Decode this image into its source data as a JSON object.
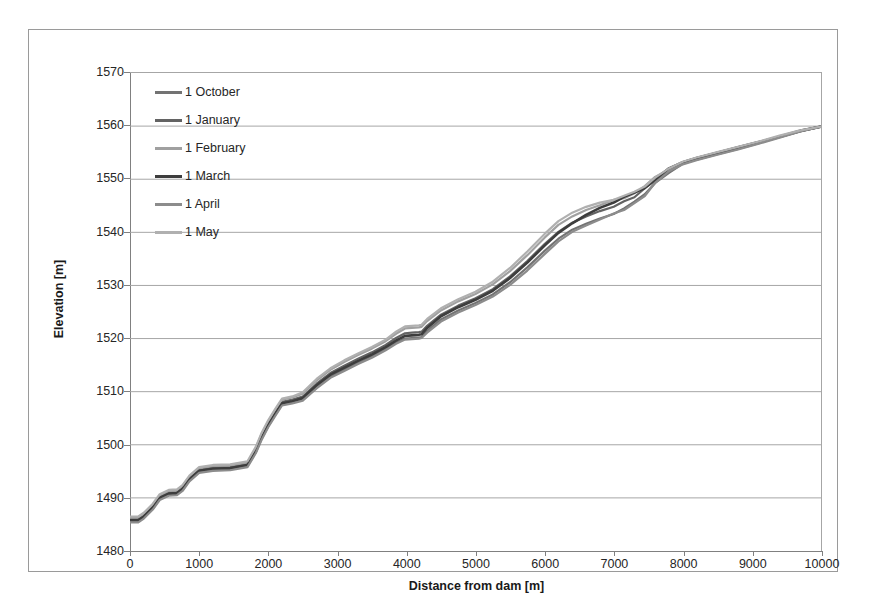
{
  "chart_data": {
    "type": "line",
    "title": "",
    "xlabel": "Distance from dam [m]",
    "ylabel": "Elevation [m]",
    "xlim": [
      0,
      10000
    ],
    "ylim": [
      1480,
      1570
    ],
    "xticks": [
      0,
      1000,
      2000,
      3000,
      4000,
      5000,
      6000,
      7000,
      8000,
      9000,
      10000
    ],
    "yticks": [
      1480,
      1490,
      1500,
      1510,
      1520,
      1530,
      1540,
      1550,
      1560,
      1570
    ],
    "grid": "horizontal",
    "legend_position": "upper-left-inside",
    "series": [
      {
        "name": "1 October",
        "color": "#737373",
        "width": 2.2,
        "x": [
          0,
          120,
          200,
          330,
          430,
          560,
          680,
          760,
          860,
          1000,
          1200,
          1450,
          1700,
          1820,
          1900,
          2000,
          2100,
          2200,
          2350,
          2500,
          2700,
          2900,
          3100,
          3300,
          3500,
          3700,
          3850,
          3980,
          4080,
          4180,
          4220,
          4300,
          4500,
          4750,
          5000,
          5250,
          5500,
          5750,
          6000,
          6200,
          6400,
          6600,
          6800,
          7000,
          7150,
          7300,
          7450,
          7600,
          7800,
          8000,
          8200,
          8500,
          8800,
          9100,
          9400,
          9700,
          10000
        ],
        "y": [
          1485.6,
          1485.6,
          1486.3,
          1488.0,
          1489.8,
          1490.6,
          1490.7,
          1491.5,
          1493.3,
          1494.9,
          1495.3,
          1495.4,
          1496.0,
          1498.6,
          1501.0,
          1503.5,
          1505.6,
          1507.6,
          1508.0,
          1508.5,
          1510.8,
          1512.8,
          1514.1,
          1515.4,
          1516.6,
          1518.0,
          1519.2,
          1520.0,
          1520.1,
          1520.2,
          1520.3,
          1521.4,
          1523.6,
          1525.3,
          1526.7,
          1528.3,
          1530.6,
          1533.4,
          1536.5,
          1538.8,
          1540.5,
          1541.6,
          1542.6,
          1543.6,
          1544.4,
          1545.6,
          1547.3,
          1549.3,
          1551.4,
          1552.9,
          1553.7,
          1554.7,
          1555.7,
          1556.8,
          1557.9,
          1559.0,
          1559.9
        ]
      },
      {
        "name": "1 January",
        "color": "#636363",
        "width": 2.2,
        "x": [
          0,
          120,
          200,
          330,
          430,
          560,
          680,
          760,
          860,
          1000,
          1200,
          1450,
          1700,
          1820,
          1900,
          2000,
          2100,
          2200,
          2350,
          2500,
          2700,
          2900,
          3100,
          3300,
          3500,
          3700,
          3850,
          3980,
          4080,
          4180,
          4220,
          4300,
          4500,
          4750,
          5000,
          5250,
          5500,
          5750,
          6000,
          6200,
          6400,
          6600,
          6800,
          7000,
          7150,
          7300,
          7450,
          7600,
          7800,
          8000,
          8200,
          8500,
          8800,
          9100,
          9400,
          9700,
          10000
        ],
        "y": [
          1486.0,
          1486.0,
          1486.7,
          1488.4,
          1490.2,
          1491.0,
          1491.1,
          1491.9,
          1493.7,
          1495.3,
          1495.7,
          1495.8,
          1496.4,
          1499.0,
          1501.5,
          1504.0,
          1506.1,
          1508.1,
          1508.5,
          1509.1,
          1511.5,
          1513.5,
          1514.9,
          1516.2,
          1517.4,
          1518.8,
          1520.1,
          1521.0,
          1521.1,
          1521.2,
          1521.3,
          1522.4,
          1524.5,
          1526.2,
          1527.6,
          1529.3,
          1531.7,
          1534.6,
          1537.8,
          1540.1,
          1541.8,
          1543.0,
          1544.0,
          1545.0,
          1545.8,
          1546.8,
          1548.2,
          1549.9,
          1551.8,
          1553.1,
          1553.9,
          1554.9,
          1555.9,
          1556.9,
          1558.0,
          1559.1,
          1559.9
        ]
      },
      {
        "name": "1 February",
        "color": "#a0a0a0",
        "width": 2.2,
        "x": [
          0,
          120,
          200,
          330,
          430,
          560,
          680,
          760,
          860,
          1000,
          1200,
          1450,
          1700,
          1820,
          1900,
          2000,
          2100,
          2200,
          2350,
          2500,
          2700,
          2900,
          3100,
          3300,
          3500,
          3700,
          3850,
          3980,
          4080,
          4180,
          4220,
          4300,
          4500,
          4750,
          5000,
          5250,
          5500,
          5750,
          6000,
          6200,
          6400,
          6600,
          6800,
          7000,
          7150,
          7300,
          7450,
          7600,
          7800,
          8000,
          8200,
          8500,
          8800,
          9100,
          9400,
          9700,
          10000
        ],
        "y": [
          1486.3,
          1486.3,
          1487.0,
          1488.7,
          1490.5,
          1491.3,
          1491.4,
          1492.2,
          1494.0,
          1495.6,
          1496.0,
          1496.1,
          1496.7,
          1499.4,
          1501.9,
          1504.4,
          1506.5,
          1508.5,
          1508.9,
          1509.6,
          1512.1,
          1514.1,
          1515.6,
          1516.9,
          1518.1,
          1519.5,
          1520.9,
          1521.9,
          1522.0,
          1522.1,
          1522.2,
          1523.3,
          1525.3,
          1527.0,
          1528.4,
          1530.2,
          1532.7,
          1535.7,
          1539.0,
          1541.4,
          1543.0,
          1544.2,
          1545.1,
          1545.9,
          1546.5,
          1547.3,
          1548.6,
          1550.2,
          1552.0,
          1553.2,
          1554.0,
          1555.0,
          1556.0,
          1557.0,
          1558.1,
          1559.2,
          1559.9
        ]
      },
      {
        "name": "1 March",
        "color": "#3d3d3d",
        "width": 2.6,
        "x": [
          0,
          120,
          200,
          330,
          430,
          560,
          680,
          760,
          860,
          1000,
          1200,
          1450,
          1700,
          1820,
          1900,
          2000,
          2100,
          2200,
          2350,
          2500,
          2700,
          2900,
          3100,
          3300,
          3500,
          3700,
          3850,
          3980,
          4080,
          4180,
          4220,
          4300,
          4500,
          4750,
          5000,
          5250,
          5500,
          5750,
          6000,
          6200,
          6400,
          6600,
          6800,
          7000,
          7150,
          7300,
          7450,
          7600,
          7800,
          8000,
          8200,
          8500,
          8800,
          9100,
          9400,
          9700,
          10000
        ],
        "y": [
          1485.8,
          1485.8,
          1486.5,
          1488.2,
          1490.0,
          1490.8,
          1490.9,
          1491.7,
          1493.5,
          1495.1,
          1495.5,
          1495.6,
          1496.2,
          1498.8,
          1501.2,
          1503.7,
          1505.8,
          1507.8,
          1508.2,
          1508.8,
          1511.2,
          1513.2,
          1514.5,
          1515.8,
          1517.0,
          1518.4,
          1519.6,
          1520.5,
          1520.6,
          1520.7,
          1520.8,
          1522.0,
          1524.2,
          1525.9,
          1527.3,
          1529.0,
          1531.4,
          1534.3,
          1537.5,
          1539.9,
          1541.7,
          1543.3,
          1544.6,
          1545.8,
          1546.5,
          1547.3,
          1548.5,
          1550.0,
          1551.9,
          1553.2,
          1554.0,
          1555.0,
          1556.0,
          1557.0,
          1558.0,
          1559.1,
          1559.9
        ]
      },
      {
        "name": "1 April",
        "color": "#8c8c8c",
        "width": 2.2,
        "x": [
          0,
          120,
          200,
          330,
          430,
          560,
          680,
          760,
          860,
          1000,
          1200,
          1450,
          1700,
          1820,
          1900,
          2000,
          2100,
          2200,
          2350,
          2500,
          2700,
          2900,
          3100,
          3300,
          3500,
          3700,
          3850,
          3980,
          4080,
          4180,
          4220,
          4300,
          4500,
          4750,
          5000,
          5250,
          5500,
          5750,
          6000,
          6200,
          6400,
          6600,
          6800,
          7000,
          7150,
          7300,
          7450,
          7600,
          7800,
          8000,
          8200,
          8500,
          8800,
          9100,
          9400,
          9700,
          10000
        ],
        "y": [
          1485.4,
          1485.4,
          1486.1,
          1487.8,
          1489.6,
          1490.4,
          1490.5,
          1491.3,
          1493.1,
          1494.7,
          1495.1,
          1495.2,
          1495.8,
          1498.4,
          1500.8,
          1503.3,
          1505.4,
          1507.4,
          1507.8,
          1508.3,
          1510.6,
          1512.6,
          1513.9,
          1515.2,
          1516.4,
          1517.8,
          1519.0,
          1519.8,
          1519.9,
          1520.0,
          1520.1,
          1521.1,
          1523.2,
          1524.9,
          1526.3,
          1527.9,
          1530.1,
          1532.8,
          1535.9,
          1538.3,
          1540.1,
          1541.3,
          1542.4,
          1543.4,
          1544.2,
          1545.4,
          1547.1,
          1549.2,
          1551.3,
          1552.8,
          1553.6,
          1554.6,
          1555.6,
          1556.7,
          1557.8,
          1559.0,
          1559.9
        ]
      },
      {
        "name": "1 May",
        "color": "#b0b0b0",
        "width": 2.2,
        "x": [
          0,
          120,
          200,
          330,
          430,
          560,
          680,
          760,
          860,
          1000,
          1200,
          1450,
          1700,
          1820,
          1900,
          2000,
          2100,
          2200,
          2350,
          2500,
          2700,
          2900,
          3100,
          3300,
          3500,
          3700,
          3850,
          3980,
          4080,
          4180,
          4220,
          4300,
          4500,
          4750,
          5000,
          5250,
          5500,
          5750,
          6000,
          6200,
          6400,
          6600,
          6800,
          7000,
          7150,
          7300,
          7450,
          7600,
          7800,
          8000,
          8200,
          8500,
          8800,
          9100,
          9400,
          9700,
          10000
        ],
        "y": [
          1486.5,
          1486.5,
          1487.2,
          1488.9,
          1490.7,
          1491.5,
          1491.6,
          1492.4,
          1494.2,
          1495.8,
          1496.2,
          1496.3,
          1496.9,
          1499.6,
          1502.1,
          1504.6,
          1506.7,
          1508.7,
          1509.1,
          1509.9,
          1512.4,
          1514.4,
          1515.9,
          1517.2,
          1518.4,
          1519.8,
          1521.3,
          1522.3,
          1522.4,
          1522.5,
          1522.6,
          1523.7,
          1525.7,
          1527.4,
          1528.8,
          1530.7,
          1533.3,
          1536.4,
          1539.7,
          1542.1,
          1543.7,
          1544.8,
          1545.6,
          1546.3,
          1546.9,
          1547.6,
          1548.8,
          1550.3,
          1552.1,
          1553.3,
          1554.1,
          1555.1,
          1556.1,
          1557.1,
          1558.2,
          1559.2,
          1559.9
        ]
      }
    ],
    "legend": [
      {
        "label": "1 October",
        "color": "#737373"
      },
      {
        "label": "1 January",
        "color": "#636363"
      },
      {
        "label": "1 February",
        "color": "#a0a0a0"
      },
      {
        "label": "1 March",
        "color": "#3d3d3d"
      },
      {
        "label": "1 April",
        "color": "#8c8c8c"
      },
      {
        "label": "1 May",
        "color": "#b0b0b0"
      }
    ],
    "gridline_color": "#a6a6a6",
    "axis_color": "#808080"
  }
}
